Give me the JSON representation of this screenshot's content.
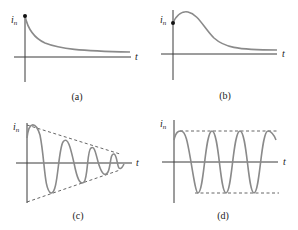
{
  "figure": {
    "panels": [
      {
        "id": "a",
        "caption": "(a)",
        "y_label": "i",
        "y_subscript": "n",
        "x_label": "t",
        "description": "overdamped: decays monotonically from initial value"
      },
      {
        "id": "b",
        "caption": "(b)",
        "y_label": "i",
        "y_subscript": "n",
        "x_label": "t",
        "description": "critically damped: rises to peak then decays"
      },
      {
        "id": "c",
        "caption": "(c)",
        "y_label": "i",
        "y_subscript": "n",
        "x_label": "t",
        "description": "underdamped: oscillation within decaying dashed envelope"
      },
      {
        "id": "d",
        "caption": "(d)",
        "y_label": "i",
        "y_subscript": "n",
        "x_label": "t",
        "description": "undamped: constant-amplitude oscillation between dashed bounds"
      }
    ],
    "colors": {
      "axis": "#3a3a3a",
      "curve": "#8a8a8a",
      "envelope": "#555555"
    }
  }
}
